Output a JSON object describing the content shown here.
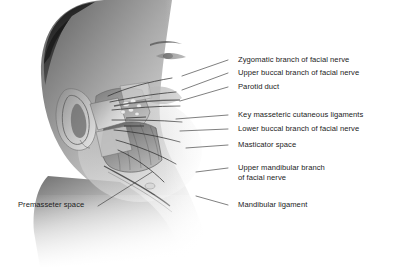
{
  "figure": {
    "kind": "anatomical-illustration",
    "width": 397,
    "height": 267,
    "background_color": "#ffffff",
    "text_color": "#1b1b1b",
    "leader_color": "#3a3a3a"
  },
  "labels": {
    "zygomatic_branch": "Zygomatic branch of facial nerve",
    "upper_buccal_branch": "Upper buccal branch of facial nerve",
    "parotid_duct": "Parotid duct",
    "key_masseteric_ligaments": "Key masseteric cutaneous ligaments",
    "lower_buccal_branch": "Lower buccal branch of facial nerve",
    "masticator_space": "Masticator space",
    "upper_mandibular_branch_line1": "Upper mandibular branch",
    "upper_mandibular_branch_line2": "of facial nerve",
    "mandibular_ligament": "Mandibular ligament",
    "premasseter_space": "Premasseter space"
  }
}
